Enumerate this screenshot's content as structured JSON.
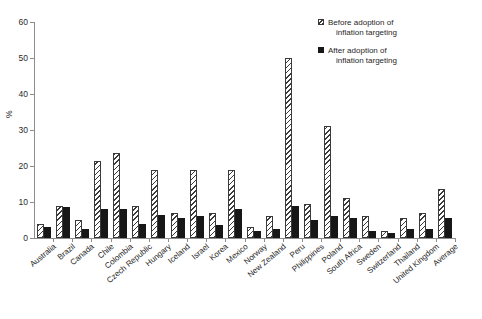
{
  "chart_data": {
    "type": "bar",
    "title": "",
    "xlabel": "",
    "ylabel": "%",
    "ylim": [
      0,
      60
    ],
    "yticks": [
      0,
      10,
      20,
      30,
      40,
      50,
      60
    ],
    "grid": false,
    "legend_position": "top-right",
    "categories": [
      "Australia",
      "Brazil",
      "Canada",
      "Chile",
      "Colombia",
      "Czech Republic",
      "Hungary",
      "Iceland",
      "Israel",
      "Korea",
      "Mexico",
      "Norway",
      "New Zealand",
      "Peru",
      "Philippines",
      "Poland",
      "South Africa",
      "Sweden",
      "Switzerland",
      "Thailand",
      "United Kingdom",
      "Average"
    ],
    "series": [
      {
        "name": "Before adoption of inflation targeting",
        "values": [
          4.0,
          9.0,
          5.0,
          21.5,
          23.5,
          9.0,
          19.0,
          7.0,
          19.0,
          7.0,
          19.0,
          3.0,
          6.0,
          50.0,
          9.5,
          31.0,
          11.0,
          6.0,
          2.0,
          5.5,
          7.0,
          13.5
        ]
      },
      {
        "name": "After adoption of inflation targeting",
        "values": [
          3.0,
          8.5,
          2.5,
          8.0,
          8.0,
          4.0,
          6.5,
          5.5,
          6.0,
          3.5,
          8.0,
          2.0,
          2.5,
          9.0,
          5.0,
          6.0,
          5.5,
          2.0,
          1.5,
          2.5,
          2.5,
          5.5
        ]
      }
    ]
  },
  "legend": {
    "entries": [
      {
        "line1": "Before adoption of",
        "line2": "inflation targeting",
        "swatch": "hatched"
      },
      {
        "line1": "After adoption of",
        "line2": "inflation targeting",
        "swatch": "solid"
      }
    ]
  }
}
